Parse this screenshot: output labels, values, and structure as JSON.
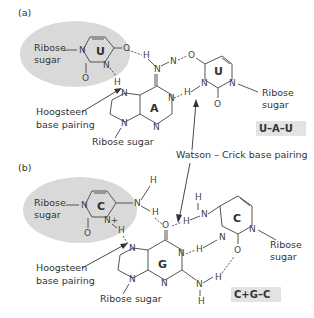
{
  "panels": [
    {
      "id": "a",
      "label": "(a)",
      "left_base": {
        "letter": "U",
        "sugar_label_1": "Ribose",
        "sugar_label_2": "sugar"
      },
      "center_base": {
        "letter": "A",
        "sugar_label": "Ribose sugar"
      },
      "right_base": {
        "letter": "U",
        "sugar_label_1": "Ribose",
        "sugar_label_2": "sugar"
      },
      "hoogsteen_label_1": "Hoogsteen",
      "hoogsteen_label_2": "base pairing",
      "triplet_tag": "U–A–U"
    },
    {
      "id": "b",
      "label": "(b)",
      "left_base": {
        "letter": "C",
        "sugar_label_1": "Ribose",
        "sugar_label_2": "sugar",
        "charge": "+"
      },
      "center_base": {
        "letter": "G",
        "sugar_label": "Ribose sugar"
      },
      "right_base": {
        "letter": "C",
        "sugar_label_1": "Ribose",
        "sugar_label_2": "sugar"
      },
      "hoogsteen_label_1": "Hoogsteen",
      "hoogsteen_label_2": "base pairing",
      "triplet_tag": "C+G–C"
    }
  ],
  "watson_crick_label": "Watson – Crick base pairing",
  "atoms": {
    "N": "N",
    "O": "O",
    "H": "H",
    "Nplus": "N+"
  },
  "colors": {
    "highlight": "#d9d9d9",
    "tag_bg": "#e3e3e3",
    "text": "#333333",
    "bond": "#555555"
  }
}
